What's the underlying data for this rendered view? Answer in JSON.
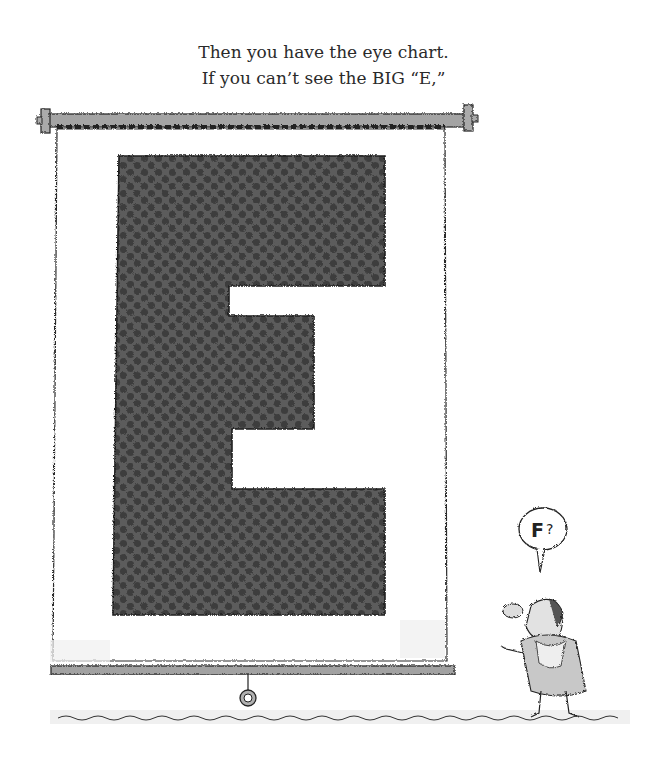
{
  "page": {
    "caption_lines": [
      "Then you have the eye chart.",
      "If you can’t see the BIG “E,”"
    ]
  },
  "illustration": {
    "chart_letter": "E",
    "speech_bubble_text": "F?",
    "colors": {
      "letter_fill": "#5a5a5a",
      "letter_dots": "#3f3f3f",
      "roller": "#9a9a9a",
      "outline": "#222222",
      "screen": "#ffffff",
      "shadow": "#e6e6e6"
    }
  }
}
